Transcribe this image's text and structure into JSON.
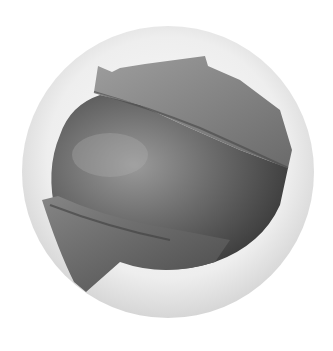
{
  "image": {
    "subject": "peeled-fruit-in-circular-frame",
    "colors": {
      "background": "#ffffff",
      "circle_light": "#f2f2f2",
      "circle_edge": "#d9d9d9",
      "fruit_mid": "#6e6e6e",
      "fruit_dark": "#3c3c3c",
      "fruit_light": "#9a9a9a",
      "peel_light": "#8c8c8c"
    }
  }
}
